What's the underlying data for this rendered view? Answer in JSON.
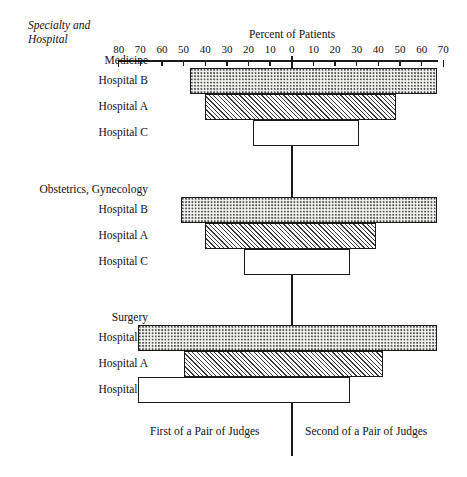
{
  "corner_caption": "Specialty and\nHospital",
  "axis_title": "Percent of Patients",
  "footer": {
    "left": "First of a Pair of Judges",
    "right": "Second of a Pair of Judges"
  },
  "chart_data": {
    "type": "bar",
    "orientation": "horizontal",
    "style": "diverging-bidirectional",
    "title": "Percent of Patients",
    "xlabel": "Percent of Patients",
    "ylabel": "Specialty and Hospital",
    "grid": false,
    "legend_position": "none",
    "xlim": [
      -80,
      70
    ],
    "xticks": [
      -80,
      -70,
      -60,
      -50,
      -40,
      -30,
      -20,
      -10,
      0,
      10,
      20,
      30,
      40,
      50,
      60,
      70
    ],
    "xtick_labels": [
      "80",
      "70",
      "60",
      "50",
      "40",
      "30",
      "20",
      "10",
      "0",
      "10",
      "20",
      "30",
      "40",
      "50",
      "60",
      "70"
    ],
    "left_side_label": "First of a Pair of Judges",
    "right_side_label": "Second of a Pair of Judges",
    "groups": [
      {
        "name": "Medicine",
        "rows": [
          {
            "label": "Hospital B",
            "left": 47,
            "right": 67,
            "fill": "dotted"
          },
          {
            "label": "Hospital A",
            "left": 40,
            "right": 48,
            "fill": "hatch"
          },
          {
            "label": "Hospital C",
            "left": 18,
            "right": 31,
            "fill": "plain"
          }
        ]
      },
      {
        "name": "Obstetrics, Gynecology",
        "rows": [
          {
            "label": "Hospital B",
            "left": 51,
            "right": 67,
            "fill": "dotted"
          },
          {
            "label": "Hospital A",
            "left": 40,
            "right": 39,
            "fill": "hatch"
          },
          {
            "label": "Hospital C",
            "left": 22,
            "right": 27,
            "fill": "plain"
          }
        ]
      },
      {
        "name": "Surgery",
        "rows": [
          {
            "label": "Hospital B",
            "left": 71,
            "right": 67,
            "fill": "dotted"
          },
          {
            "label": "Hospital A",
            "left": 50,
            "right": 42,
            "fill": "hatch"
          },
          {
            "label": "Hospital C",
            "left": 71,
            "right": 27,
            "fill": "plain"
          }
        ]
      }
    ]
  }
}
